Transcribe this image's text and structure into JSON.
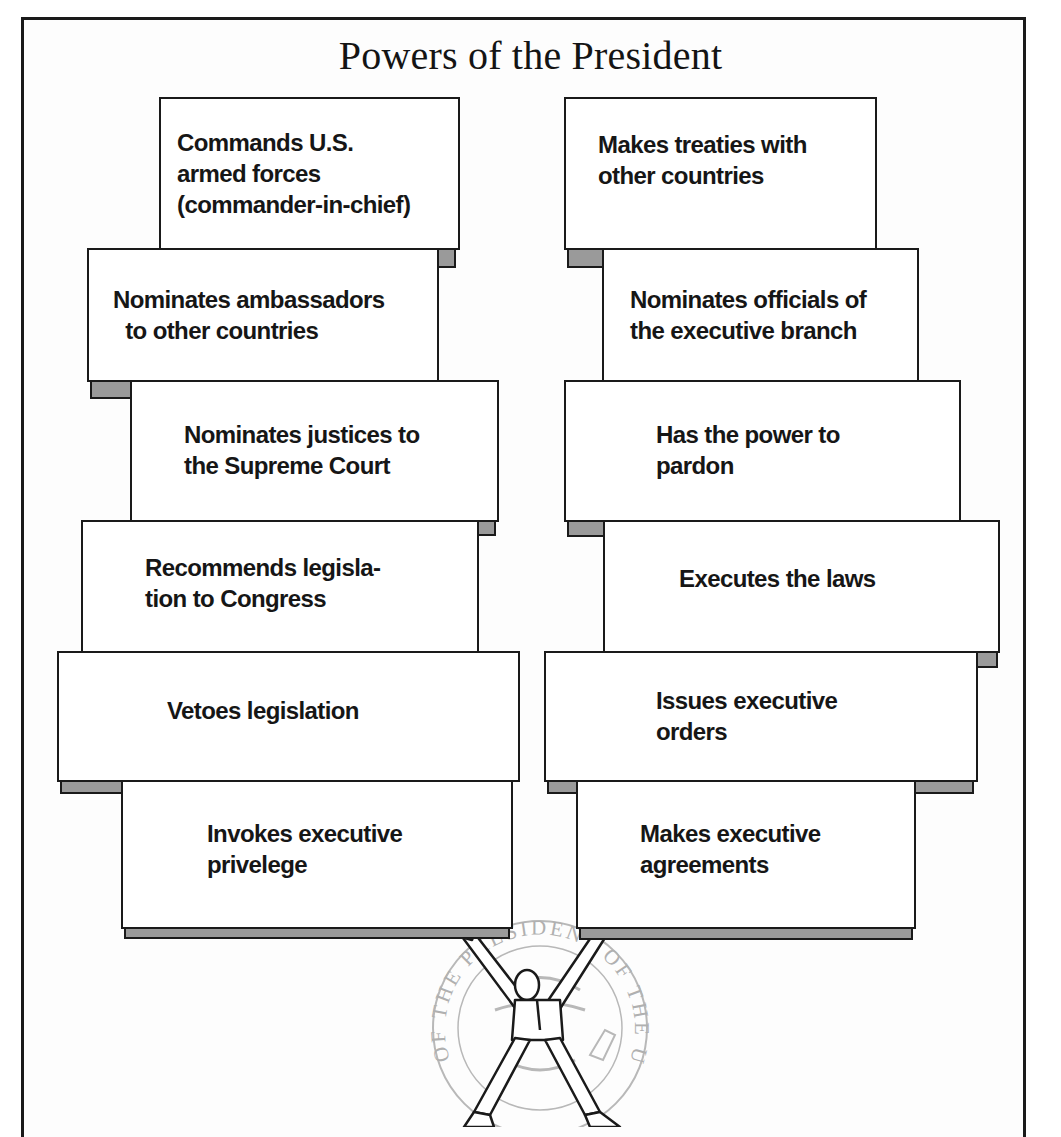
{
  "title": "Powers of the President",
  "colors": {
    "border": "#1a1a1a",
    "shadow": "#9a9a9a",
    "seal": "#b8b8b8",
    "background": "#ffffff"
  },
  "left_column": {
    "blocks": [
      {
        "label": "Commands U.S.\narmed forces\n(commander-in-chief)"
      },
      {
        "label": "Nominates ambassadors\n  to other countries"
      },
      {
        "label": "Nominates justices to\nthe Supreme Court"
      },
      {
        "label": "Recommends legisla-\ntion to Congress"
      },
      {
        "label": "Vetoes legislation"
      },
      {
        "label": "Invokes executive\nprivelege"
      }
    ]
  },
  "right_column": {
    "blocks": [
      {
        "label": "Makes treaties with\nother countries"
      },
      {
        "label": "Nominates officials of\nthe executive branch"
      },
      {
        "label": "Has the power to\npardon"
      },
      {
        "label": "Executes the laws"
      },
      {
        "label": "Issues executive\norders"
      },
      {
        "label": "Makes executive\nagreements"
      }
    ]
  },
  "illustration": {
    "figure": "president-holding-up-blocks",
    "seal_text": "OF THE PRESIDENT OF THE UNITED STATES"
  }
}
